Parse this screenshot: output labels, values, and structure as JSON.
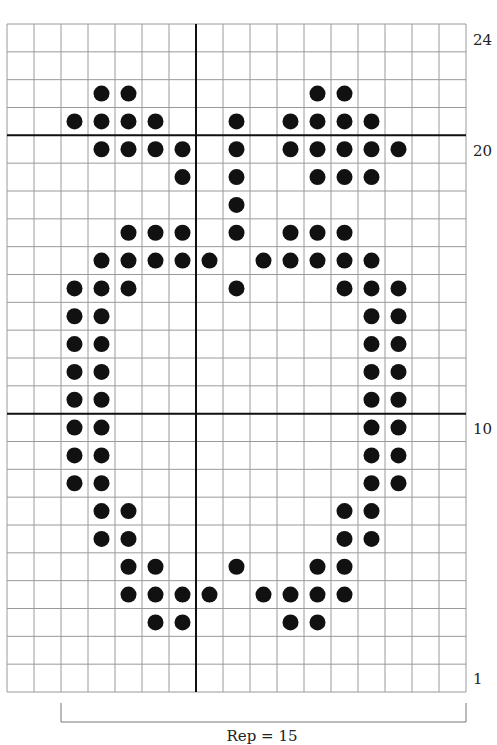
{
  "chart_data": {
    "type": "knitting-chart",
    "columns": 17,
    "rows": 24,
    "grid": {
      "left": 7,
      "top": 24,
      "right": 466,
      "bottom": 692
    },
    "colors": {
      "grid_line": "#9a9a9a",
      "thick_line": "#111111",
      "dot": "#111111",
      "background": "#ffffff"
    },
    "thick_vertical_after_col": [
      7
    ],
    "thick_horizontal_above_row": [
      20,
      10
    ],
    "row_labels": [
      {
        "row": 24,
        "text": "24"
      },
      {
        "row": 20,
        "text": "20"
      },
      {
        "row": 10,
        "text": "10"
      },
      {
        "row": 1,
        "text": "1"
      }
    ],
    "dots": {
      "22": [
        4,
        5,
        12,
        13
      ],
      "21": [
        3,
        4,
        5,
        6,
        9,
        11,
        12,
        13,
        14
      ],
      "20": [
        4,
        5,
        6,
        7,
        9,
        11,
        12,
        13,
        14,
        15
      ],
      "19": [
        7,
        9,
        12,
        13,
        14
      ],
      "18": [
        9
      ],
      "17": [
        5,
        6,
        7,
        9,
        11,
        12,
        13
      ],
      "16": [
        4,
        5,
        6,
        7,
        8,
        10,
        11,
        12,
        13,
        14
      ],
      "15": [
        3,
        4,
        5,
        9,
        13,
        14,
        15
      ],
      "14": [
        3,
        4,
        14,
        15
      ],
      "13": [
        3,
        4,
        14,
        15
      ],
      "12": [
        3,
        4,
        14,
        15
      ],
      "11": [
        3,
        4,
        14,
        15
      ],
      "10": [
        3,
        4,
        14,
        15
      ],
      "9": [
        3,
        4,
        14,
        15
      ],
      "8": [
        3,
        4,
        14,
        15
      ],
      "7": [
        4,
        5,
        13,
        14
      ],
      "6": [
        4,
        5,
        13,
        14
      ],
      "5": [
        5,
        6,
        9,
        12,
        13
      ],
      "4": [
        5,
        6,
        7,
        8,
        10,
        11,
        12,
        13
      ],
      "3": [
        6,
        7,
        11,
        12
      ]
    },
    "repeat": {
      "from_col": 3,
      "to_col": 17,
      "label": "Rep = 15"
    }
  },
  "labels": {
    "row_24": "24",
    "row_20": "20",
    "row_10": "10",
    "row_1": "1",
    "repeat": "Rep = 15"
  }
}
